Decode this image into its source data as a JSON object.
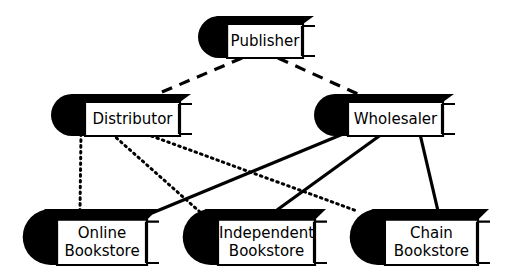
{
  "diagram": {
    "type": "node-link-diagram",
    "background_color": "#ffffff",
    "ink_color": "#000000",
    "nodes": [
      {
        "id": "publisher",
        "label": "Publisher",
        "icon": "book-icon",
        "lines": [
          "Publisher"
        ],
        "tier": "top",
        "box": {
          "x": 202,
          "y": 16,
          "w": 114,
          "h": 42
        },
        "font_size": 15
      },
      {
        "id": "distributor",
        "label": "Distributor",
        "icon": "book-icon",
        "lines": [
          "Distributor"
        ],
        "tier": "middle",
        "box": {
          "x": 55,
          "y": 94,
          "w": 138,
          "h": 42
        },
        "font_size": 15
      },
      {
        "id": "wholesaler",
        "label": "Wholesaler",
        "icon": "book-icon",
        "lines": [
          "Wholesaler"
        ],
        "tier": "middle",
        "box": {
          "x": 318,
          "y": 94,
          "w": 138,
          "h": 42
        },
        "font_size": 15
      },
      {
        "id": "online-bookstore",
        "label": "Online Bookstore",
        "icon": "book-icon",
        "lines": [
          "Online",
          "Bookstore"
        ],
        "tier": "bottom",
        "box": {
          "x": 28,
          "y": 209,
          "w": 132,
          "h": 56
        },
        "font_size": 15
      },
      {
        "id": "independent-bookstore",
        "label": "Independent Bookstore",
        "icon": "book-icon",
        "lines": [
          "Independent",
          "Bookstore"
        ],
        "tier": "bottom",
        "box": {
          "x": 188,
          "y": 209,
          "w": 140,
          "h": 56
        },
        "font_size": 15
      },
      {
        "id": "chain-bookstore",
        "label": "Chain Bookstore",
        "icon": "book-icon",
        "lines": [
          "Chain",
          "Bookstore"
        ],
        "tier": "bottom",
        "box": {
          "x": 355,
          "y": 209,
          "w": 136,
          "h": 56
        },
        "font_size": 15
      }
    ],
    "edges": [
      {
        "id": "publisher-to-distributor",
        "from": "publisher",
        "to": "distributor",
        "style": "dashed",
        "x1": 242,
        "y1": 58,
        "x2": 155,
        "y2": 95
      },
      {
        "id": "publisher-to-wholesaler",
        "from": "publisher",
        "to": "wholesaler",
        "style": "dashed",
        "x1": 278,
        "y1": 58,
        "x2": 360,
        "y2": 95
      },
      {
        "id": "distributor-to-online-bookstore",
        "from": "distributor",
        "to": "online-bookstore",
        "style": "dotted",
        "x1": 81,
        "y1": 134,
        "x2": 80,
        "y2": 211
      },
      {
        "id": "distributor-to-independent-bookstore",
        "from": "distributor",
        "to": "independent-bookstore",
        "style": "dotted",
        "x1": 112,
        "y1": 134,
        "x2": 200,
        "y2": 212
      },
      {
        "id": "distributor-to-chain-bookstore",
        "from": "distributor",
        "to": "chain-bookstore",
        "style": "dotted",
        "x1": 146,
        "y1": 134,
        "x2": 357,
        "y2": 211
      },
      {
        "id": "wholesaler-to-online-bookstore",
        "from": "wholesaler",
        "to": "online-bookstore",
        "style": "solid",
        "x1": 343,
        "y1": 134,
        "x2": 152,
        "y2": 213
      },
      {
        "id": "wholesaler-to-independent-bookstore",
        "from": "wholesaler",
        "to": "independent-bookstore",
        "style": "solid",
        "x1": 382,
        "y1": 134,
        "x2": 277,
        "y2": 210
      },
      {
        "id": "wholesaler-to-chain-bookstore",
        "from": "wholesaler",
        "to": "chain-bookstore",
        "style": "solid",
        "x1": 420,
        "y1": 134,
        "x2": 438,
        "y2": 211
      }
    ]
  }
}
